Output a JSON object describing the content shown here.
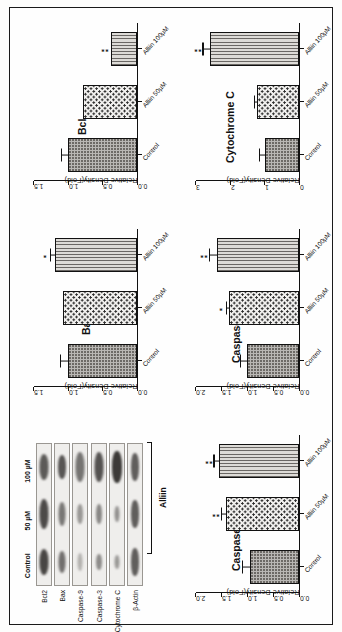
{
  "figure": {
    "treatment_label": "Alliin",
    "axis_title": "Relative Density(Fold)"
  },
  "blot": {
    "lane_labels": [
      "Control",
      "50 µM",
      "100 µM"
    ],
    "rows": [
      {
        "name": "Bcl2"
      },
      {
        "name": "Bax"
      },
      {
        "name": "Caspase-9"
      },
      {
        "name": "Caspase-3"
      },
      {
        "name": "Cytochrome C"
      },
      {
        "name": "β-Actin"
      }
    ]
  },
  "chart_data": [
    {
      "type": "bar",
      "title": "Bax",
      "xlabel": "",
      "ylabel": "Relative Density(Fold)",
      "categories": [
        "Control",
        "Alliin 50µM",
        "Alliin 100µM"
      ],
      "values": [
        1.0,
        1.08,
        1.2
      ],
      "errors": [
        0.1,
        0.0,
        0.05
      ],
      "significance": [
        "",
        "",
        "*"
      ],
      "ylim": [
        0.0,
        1.5
      ],
      "yticks": [
        "0.0",
        "0.5",
        "1.0",
        "1.5"
      ],
      "ytickvals": [
        0.0,
        0.5,
        1.0,
        1.5
      ],
      "grid": false,
      "legend": "none"
    },
    {
      "type": "bar",
      "title": "Bcl₂",
      "xlabel": "",
      "ylabel": "Relative Density(Fold)",
      "categories": [
        "Control",
        "Alliin 50µM",
        "Alliin 100µM"
      ],
      "values": [
        1.0,
        0.78,
        0.38
      ],
      "errors": [
        0.09,
        0.0,
        0.0
      ],
      "significance": [
        "",
        "",
        "**"
      ],
      "ylim": [
        0.0,
        1.5
      ],
      "yticks": [
        "0.0",
        "0.5",
        "1.0",
        "1.5"
      ],
      "ytickvals": [
        0.0,
        0.5,
        1.0,
        1.5
      ],
      "grid": false,
      "legend": "none"
    },
    {
      "type": "bar",
      "title": "Caspase-3",
      "xlabel": "",
      "ylabel": "Relative Density(Fold)",
      "categories": [
        "Control",
        "Alliin 50µM",
        "Alliin 100µM"
      ],
      "values": [
        0.95,
        1.42,
        1.55
      ],
      "errors": [
        0.14,
        0.07,
        0.09
      ],
      "significance": [
        "",
        "**",
        "**"
      ],
      "ylim": [
        0.0,
        2.0
      ],
      "yticks": [
        "0.0",
        "0.5",
        "1.0",
        "1.5",
        "2.0"
      ],
      "ytickvals": [
        0.0,
        0.5,
        1.0,
        1.5,
        2.0
      ],
      "grid": false,
      "legend": "none"
    },
    {
      "type": "bar",
      "title": "Caspase -9",
      "xlabel": "",
      "ylabel": "Relative Density(Fold)",
      "categories": [
        "Control",
        "Alliin 50µM",
        "Alliin 100µM"
      ],
      "values": [
        1.0,
        1.35,
        1.6
      ],
      "errors": [
        0.12,
        0.05,
        0.12
      ],
      "significance": [
        "",
        "*",
        "**"
      ],
      "ylim": [
        0.0,
        2.0
      ],
      "yticks": [
        "0.0",
        "0.5",
        "1.0",
        "1.5",
        "2.0"
      ],
      "ytickvals": [
        0.0,
        0.5,
        1.0,
        1.5,
        2.0
      ],
      "grid": false,
      "legend": "none"
    },
    {
      "type": "bar",
      "title": "Cytochrome C",
      "xlabel": "",
      "ylabel": "Relative Density(Fold)",
      "categories": [
        "Control",
        "Alliin 50µM",
        "Alliin 100µM"
      ],
      "values": [
        1.0,
        1.22,
        2.6
      ],
      "errors": [
        0.13,
        0.07,
        0.18
      ],
      "significance": [
        "",
        "",
        "**"
      ],
      "ylim": [
        0.0,
        3.0
      ],
      "yticks": [
        "0",
        "1",
        "2",
        "3"
      ],
      "ytickvals": [
        0.0,
        1.0,
        2.0,
        3.0
      ],
      "grid": false,
      "legend": "none"
    }
  ]
}
